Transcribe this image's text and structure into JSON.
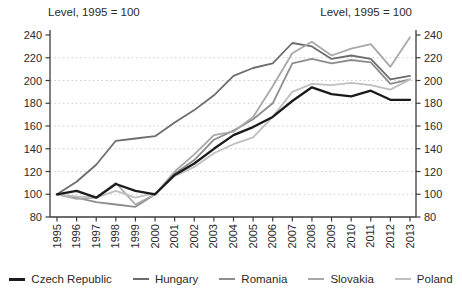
{
  "chart_data": {
    "type": "line",
    "title_left": "Level, 1995 = 100",
    "title_right": "Level, 1995 = 100",
    "x": [
      1995,
      1996,
      1997,
      1998,
      1999,
      2000,
      2001,
      2002,
      2003,
      2004,
      2005,
      2006,
      2007,
      2008,
      2009,
      2010,
      2011,
      2012,
      2013
    ],
    "series": [
      {
        "name": "Czech Republic",
        "color": "#1a1a1a",
        "width": 2.3,
        "values": [
          100,
          103,
          97,
          109,
          103,
          100,
          117,
          127,
          140,
          152,
          159,
          168,
          182,
          194,
          188,
          186,
          191,
          183,
          183
        ]
      },
      {
        "name": "Hungary",
        "color": "#6d6d6d",
        "width": 1.8,
        "values": [
          100,
          111,
          126,
          147,
          149,
          151,
          163,
          174,
          187,
          204,
          211,
          215,
          233,
          230,
          219,
          222,
          219,
          201,
          204
        ]
      },
      {
        "name": "Romania",
        "color": "#8d8d8d",
        "width": 1.8,
        "values": [
          100,
          97,
          93,
          91,
          89,
          100,
          118,
          130,
          148,
          156,
          166,
          180,
          215,
          219,
          215,
          218,
          216,
          197,
          201
        ]
      },
      {
        "name": "Slovakia",
        "color": "#a8a8a8",
        "width": 1.8,
        "values": [
          100,
          96,
          97,
          110,
          91,
          100,
          120,
          135,
          152,
          155,
          168,
          195,
          224,
          234,
          222,
          228,
          232,
          212,
          238
        ]
      },
      {
        "name": "Poland",
        "color": "#bfbfbf",
        "width": 1.8,
        "values": [
          100,
          98,
          97,
          103,
          97,
          101,
          116,
          124,
          136,
          144,
          150,
          168,
          190,
          197,
          196,
          198,
          196,
          192,
          201
        ]
      }
    ],
    "ylim": [
      80,
      240
    ],
    "ytick_step": 20,
    "grid": "dotted horizontal lines at each 20 units (100-220)",
    "legend_position": "bottom",
    "axis_color": "#3c3c3c",
    "grid_color": "#cccccc"
  }
}
